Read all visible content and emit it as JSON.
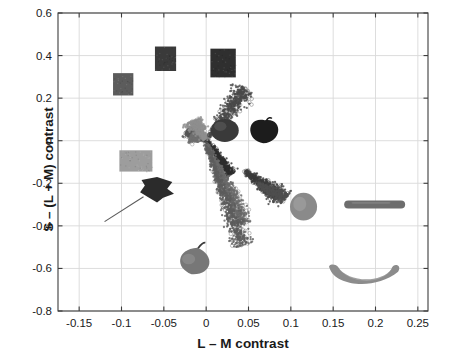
{
  "chart_data": {
    "type": "scatter",
    "title": "",
    "xlabel": "L – M contrast",
    "ylabel": "S – (L + M) contrast",
    "xlim": [
      -0.175,
      0.262
    ],
    "ylim": [
      -0.8,
      0.6
    ],
    "xticks": [
      "-0.15",
      "-0.1",
      "-0.05",
      "0",
      "0.05",
      "0.1",
      "0.15",
      "0.2",
      "0.25"
    ],
    "xtick_values": [
      -0.15,
      -0.1,
      -0.05,
      0,
      0.05,
      0.1,
      0.15,
      0.2,
      0.25
    ],
    "yticks": [
      "0.6",
      "0.4",
      "0.2",
      "0",
      "-0.2",
      "-0.4",
      "-0.6",
      "-0.8"
    ],
    "ytick_values": [
      0.6,
      0.4,
      0.2,
      0,
      -0.2,
      -0.4,
      -0.6,
      -0.8
    ],
    "grid": true,
    "legend": "none",
    "marker": "circle-open",
    "series": [
      {
        "name": "cluster-upper-right-steep",
        "color": "#4a4a4a",
        "origin": [
          0.0,
          0.0
        ],
        "angle_deg": 57,
        "length": 0.47,
        "spread": 0.035,
        "n": 520
      },
      {
        "name": "cluster-upper-left-shallow",
        "color": "#555555",
        "origin": [
          0.0,
          0.0
        ],
        "angle_deg": 147,
        "length": 0.145,
        "spread": 0.022,
        "n": 430
      },
      {
        "name": "cluster-left-mid",
        "color": "#6f6f6f",
        "origin": [
          -0.008,
          0.005
        ],
        "angle_deg": 160,
        "length": 0.06,
        "spread": 0.022,
        "n": 300
      },
      {
        "name": "cluster-center-light",
        "color": "#8f8f8f",
        "origin": [
          0.0,
          0.0
        ],
        "angle_deg": 118,
        "length": 0.175,
        "spread": 0.03,
        "n": 420
      },
      {
        "name": "cluster-lower-right-dark",
        "color": "#2e2e2e",
        "origin": [
          0.0,
          0.0
        ],
        "angle_deg": -58,
        "length": 0.3,
        "spread": 0.022,
        "n": 420
      },
      {
        "name": "cluster-lower-right-mid",
        "color": "#6a6a6a",
        "origin": [
          0.0,
          -0.01
        ],
        "angle_deg": -68,
        "length": 0.66,
        "spread": 0.03,
        "n": 700
      },
      {
        "name": "cluster-lower-right-long",
        "color": "#5d5d5d",
        "origin": [
          0.0,
          -0.02
        ],
        "angle_deg": -73,
        "length": 0.8,
        "spread": 0.028,
        "n": 620
      },
      {
        "name": "cluster-far-right-dark",
        "color": "#3c3c3c",
        "origin": [
          0.045,
          -0.14
        ],
        "angle_deg": -41,
        "length": 0.3,
        "spread": 0.03,
        "n": 560
      },
      {
        "name": "cluster-right-tail",
        "color": "#4f4f4f",
        "origin": [
          0.06,
          -0.2
        ],
        "angle_deg": -33,
        "length": 0.22,
        "spread": 0.026,
        "n": 380
      }
    ],
    "image_insets": [
      {
        "name": "gray-square-patch-upper-left",
        "kind": "square",
        "x": -0.098,
        "y": 0.265,
        "w": 0.024,
        "h": 0.105,
        "fill": "#5c5c5c"
      },
      {
        "name": "dark-square-patch-upper-mid",
        "kind": "square",
        "x": -0.048,
        "y": 0.385,
        "w": 0.025,
        "h": 0.115,
        "fill": "#3a3a3a"
      },
      {
        "name": "dark-square-patch-upper-right",
        "kind": "square",
        "x": 0.02,
        "y": 0.365,
        "w": 0.03,
        "h": 0.135,
        "fill": "#2f2f2f"
      },
      {
        "name": "light-gray-patch-left",
        "kind": "square",
        "x": -0.083,
        "y": -0.095,
        "w": 0.039,
        "h": 0.1,
        "fill": "#9d9d9d"
      },
      {
        "name": "sphere-fruit",
        "kind": "round",
        "x": 0.022,
        "y": 0.048,
        "w": 0.033,
        "h": 0.108,
        "fill": "#3a3a3a"
      },
      {
        "name": "apple-fruit",
        "kind": "apple",
        "x": 0.069,
        "y": 0.052,
        "w": 0.039,
        "h": 0.13,
        "fill": "#1c1c1c"
      },
      {
        "name": "dark-leaf-object",
        "kind": "leaf",
        "x": -0.058,
        "y": -0.23,
        "w": 0.04,
        "h": 0.12,
        "fill": "#2b2b2b"
      },
      {
        "name": "pear-fruit",
        "kind": "pear",
        "x": -0.013,
        "y": -0.553,
        "w": 0.043,
        "h": 0.155,
        "fill": "#777777"
      },
      {
        "name": "mango-fruit",
        "kind": "mango",
        "x": 0.115,
        "y": -0.31,
        "w": 0.032,
        "h": 0.13,
        "fill": "#8a8a8a"
      },
      {
        "name": "cucumber-vegetable",
        "kind": "cucumber",
        "x": 0.199,
        "y": -0.3,
        "w": 0.072,
        "h": 0.068,
        "fill": "#6d6d6d"
      },
      {
        "name": "banana-fruit",
        "kind": "banana",
        "x": 0.188,
        "y": -0.628,
        "w": 0.09,
        "h": 0.15,
        "fill": "#8c8c8c"
      }
    ]
  },
  "axes": {
    "frame_color": "#3d3d3d",
    "grid_color": "#d9d9d9",
    "background": "#ffffff"
  }
}
